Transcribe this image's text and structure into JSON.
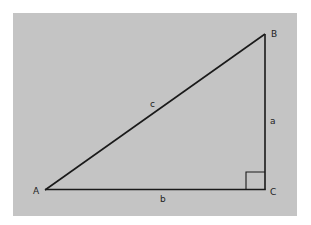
{
  "diagram": {
    "type": "right-triangle",
    "background_color": "#c4c4c4",
    "line_color": "#1a1a1a",
    "vertices": {
      "A": {
        "label": "A",
        "x": 45,
        "y": 190
      },
      "B": {
        "label": "B",
        "x": 265,
        "y": 34
      },
      "C": {
        "label": "C",
        "x": 265,
        "y": 189
      }
    },
    "sides": {
      "a": {
        "label": "a",
        "from": "B",
        "to": "C"
      },
      "b": {
        "label": "b",
        "from": "A",
        "to": "C"
      },
      "c": {
        "label": "c",
        "from": "A",
        "to": "B"
      }
    },
    "right_angle_at": "C"
  }
}
